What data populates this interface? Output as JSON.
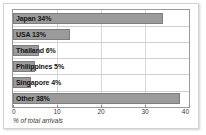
{
  "chart_data": {
    "type": "bar",
    "orientation": "horizontal",
    "title": "",
    "xlabel": "% of total arrivals",
    "ylabel": "",
    "categories": [
      "Japan",
      "USA",
      "Thailand",
      "Philippines",
      "Singapore",
      "Other"
    ],
    "values": [
      34,
      13,
      6,
      5,
      4,
      38
    ],
    "bar_labels": [
      "Japan 34%",
      "USA 13%",
      "Thailand 6%",
      "Philippines 5%",
      "Singapore 4%",
      "Other 38%"
    ],
    "xlim": [
      0,
      40
    ],
    "xticks": [
      0,
      10,
      20,
      30,
      40
    ],
    "xtick_labels": [
      "0",
      "10",
      "20",
      "30",
      "40"
    ],
    "grid": "vertical",
    "legend": "none",
    "colors": {
      "bar_fill": "#9b9b9b",
      "bar_stroke": "#7d7d7d",
      "plot_border": "#9a9a9a",
      "gridline": "#d8d8d8",
      "card_border": "#d2d2d2",
      "background": "#ffffff",
      "label_text": "#151515",
      "axis_text": "#3a3a3a"
    }
  }
}
